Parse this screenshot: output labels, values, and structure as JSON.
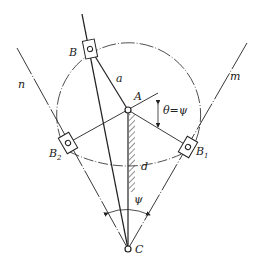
{
  "diagram": {
    "type": "mechanism",
    "colors": {
      "line": "#222222",
      "background": "#ffffff"
    },
    "labels": {
      "B": "B",
      "B1_base": "B",
      "B1_sub": "1",
      "B2_base": "B",
      "B2_sub": "2",
      "A": "A",
      "C": "C",
      "a": "a",
      "d": "d",
      "n": "n",
      "m": "m",
      "theta_eq_psi": "θ=ψ",
      "psi": "ψ"
    },
    "points": {
      "A": [
        128,
        110
      ],
      "C": [
        128,
        249
      ],
      "B": [
        90,
        49
      ],
      "B1": [
        188,
        147
      ],
      "B2": [
        68,
        143
      ]
    },
    "circle_radius": 72
  }
}
